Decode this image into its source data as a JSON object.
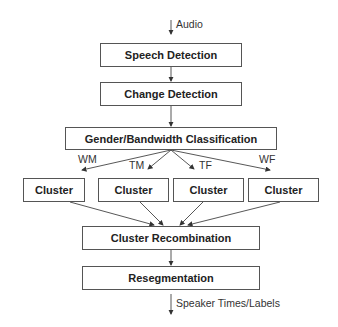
{
  "diagram": {
    "input_label": "Audio",
    "output_label": "Speaker Times/Labels",
    "stages": {
      "speech_detection": "Speech Detection",
      "change_detection": "Change Detection",
      "classification": "Gender/Bandwidth Classification",
      "clusters": [
        "Cluster",
        "Cluster",
        "Cluster",
        "Cluster"
      ],
      "recombination": "Cluster Recombination",
      "resegmentation": "Resegmentation"
    },
    "branch_labels": [
      "WM",
      "TM",
      "TF",
      "WF"
    ]
  }
}
